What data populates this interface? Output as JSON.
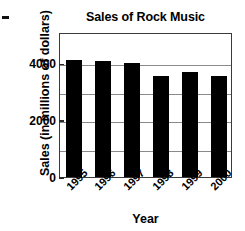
{
  "chart_data": {
    "type": "bar",
    "title": "Sales of Rock Music",
    "xlabel": "Year",
    "ylabel": "Sales (in millions of dollars)",
    "categories": [
      "1995",
      "1996",
      "1997",
      "1998",
      "1999",
      "2000"
    ],
    "values": [
      4100,
      4070,
      4000,
      3570,
      3680,
      3570
    ],
    "ylim": [
      0,
      5100
    ],
    "yticks": [
      0,
      2000,
      4000
    ],
    "ytick_labels": [
      "0",
      "2000",
      "4000"
    ],
    "gridlines": [
      1000,
      2000,
      3000,
      4000
    ],
    "grid": true,
    "legend": null,
    "bar_color": "#000000",
    "axis_color": "#3a3a3a",
    "grid_color": "#8a8a8a",
    "xtick_rotation": -45
  }
}
